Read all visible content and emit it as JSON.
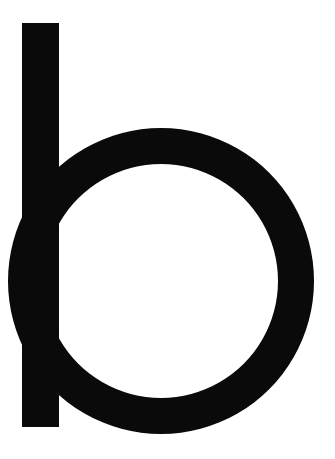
{
  "glyph": {
    "character": "b",
    "color": "#0a0a0a",
    "background": "#ffffff"
  }
}
